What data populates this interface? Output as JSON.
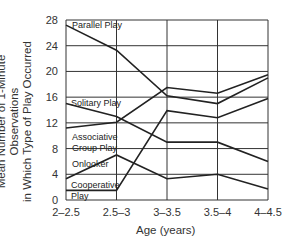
{
  "chart_data": {
    "type": "line",
    "title": "",
    "xlabel": "Age (years)",
    "ylabel_line1": "Mean Number of 1-Minute Observations",
    "ylabel_line2": "in Which Type of Play Occurred",
    "categories": [
      "2–2.5",
      "2.5–3",
      "3–3.5",
      "3.5–4",
      "4–4.5"
    ],
    "yticks": [
      0,
      4,
      8,
      12,
      16,
      20,
      24,
      28
    ],
    "ylim": [
      0,
      28
    ],
    "grid": true,
    "series": [
      {
        "name": "Parallel Play",
        "values": [
          27.2,
          23.3,
          16.2,
          15.0,
          19.0
        ]
      },
      {
        "name": "Solitary Play",
        "values": [
          15.0,
          13.0,
          9.0,
          9.0,
          6.0
        ]
      },
      {
        "name": "Associative Group Play",
        "values": [
          11.2,
          12.1,
          17.5,
          16.6,
          19.5
        ]
      },
      {
        "name": "Onlooker",
        "values": [
          3.3,
          7.0,
          3.3,
          4.0,
          1.7
        ]
      },
      {
        "name": "Cooperative Play",
        "values": [
          1.5,
          1.5,
          13.9,
          12.8,
          15.8
        ]
      }
    ],
    "annotations": [
      {
        "text": "Parallel Play",
        "x": 72,
        "y": 28
      },
      {
        "text": "Solitary Play",
        "x": 71,
        "y": 106
      },
      {
        "text": "Associative",
        "x": 72,
        "y": 140
      },
      {
        "text": "Group Play",
        "x": 72,
        "y": 151
      },
      {
        "text": "Onlooker",
        "x": 72,
        "y": 167
      },
      {
        "text": "Cooperative",
        "x": 71,
        "y": 188
      },
      {
        "text": "Play",
        "x": 71,
        "y": 199
      }
    ]
  }
}
